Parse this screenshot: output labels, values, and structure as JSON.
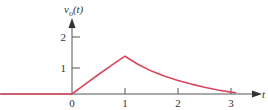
{
  "chart_data": {
    "type": "line",
    "title": "",
    "ylabel": "v_o(t)",
    "xlabel": "t",
    "x_ticks": [
      "0",
      "1",
      "2",
      "3"
    ],
    "y_ticks": [
      "1",
      "2"
    ],
    "xlim": [
      -1.35,
      3.5
    ],
    "ylim": [
      0,
      2.7
    ],
    "grid": false,
    "legend": null,
    "series": [
      {
        "name": "v_o(t)",
        "color": "#d9475f",
        "x": [
          -1.35,
          0,
          0.25,
          0.5,
          0.75,
          1,
          1.25,
          1.5,
          1.75,
          2,
          2.25,
          2.5,
          2.75,
          3,
          3.1
        ],
        "y": [
          0,
          0,
          0.32,
          0.63,
          0.93,
          1.22,
          0.95,
          0.74,
          0.57,
          0.44,
          0.32,
          0.22,
          0.13,
          0.06,
          0.04
        ]
      }
    ]
  },
  "labels": {
    "y_axis_label_main": "v",
    "y_axis_label_sub": "o",
    "y_axis_label_arg": "(t)",
    "x_axis_label": "t",
    "tick_x0": "0",
    "tick_x1": "1",
    "tick_x2": "2",
    "tick_x3": "3",
    "tick_y1": "1",
    "tick_y2": "2"
  },
  "colors": {
    "curve": "#d9475f",
    "axis": "#555555",
    "text": "#333333"
  }
}
